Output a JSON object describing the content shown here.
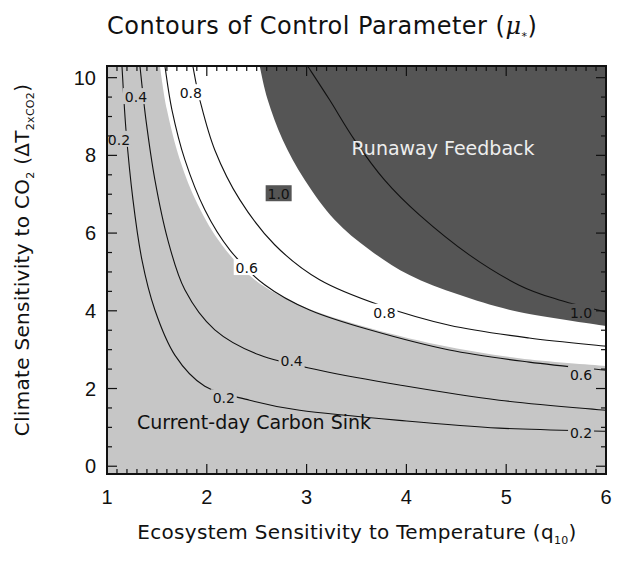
{
  "chart": {
    "title_main": "Contours of Control Parameter (",
    "title_symbol": "μ",
    "title_sub": "*",
    "title_end": ")",
    "xlabel_main": "Ecosystem Sensitivity to Temperature (q",
    "xlabel_sub": "10",
    "xlabel_end": ")",
    "ylabel_main": "Climate Sensitivity to CO",
    "ylabel_sub1": "2",
    "ylabel_mid": " (ΔT",
    "ylabel_sub2": "2xCO2",
    "ylabel_end": ")"
  },
  "chart_data": {
    "type": "contour",
    "title": "Contours of Control Parameter (μ*)",
    "xlabel": "Ecosystem Sensitivity to Temperature (q10)",
    "ylabel": "Climate Sensitivity to CO2 (ΔT2xCO2)",
    "xlim": [
      1,
      6
    ],
    "ylim": [
      -0.2,
      10.3
    ],
    "xticks": [
      1,
      2,
      3,
      4,
      5,
      6
    ],
    "yticks": [
      0,
      2,
      4,
      6,
      8,
      10
    ],
    "x_minor_step": 0.1,
    "y_minor_step": 0.5,
    "grid": false,
    "colors": {
      "current_sink_region": "#c6c6c6",
      "transition_band": "#ffffff",
      "runaway_region": "#555555",
      "contour_line": "#111111"
    },
    "regions": [
      {
        "name": "Current-day Carbon Sink",
        "fill": "#c6c6c6",
        "label_pos": [
          1.3,
          0.95
        ]
      },
      {
        "name": "Runaway Feedback",
        "fill": "#555555",
        "label_pos": [
          3.45,
          8.0
        ]
      }
    ],
    "band_boundaries": {
      "white_lower": [
        [
          1.53,
          10.3
        ],
        [
          1.6,
          9.18
        ],
        [
          1.73,
          7.89
        ],
        [
          1.91,
          6.73
        ],
        [
          2.15,
          5.7
        ],
        [
          2.48,
          4.8
        ],
        [
          2.93,
          4.15
        ],
        [
          3.53,
          3.63
        ],
        [
          4.33,
          3.12
        ],
        [
          5.13,
          2.78
        ],
        [
          6.0,
          2.58
        ]
      ],
      "dark_lower": [
        [
          2.53,
          10.3
        ],
        [
          2.61,
          9.43
        ],
        [
          2.76,
          8.4
        ],
        [
          2.98,
          7.37
        ],
        [
          3.28,
          6.34
        ],
        [
          3.63,
          5.57
        ],
        [
          4.03,
          4.92
        ],
        [
          4.53,
          4.41
        ],
        [
          5.13,
          3.97
        ],
        [
          6.0,
          3.61
        ]
      ]
    },
    "contours": [
      {
        "level": 0.2,
        "label": "0.2",
        "points": [
          [
            1.15,
            10.3
          ],
          [
            1.19,
            8.66
          ],
          [
            1.26,
            6.86
          ],
          [
            1.35,
            5.31
          ],
          [
            1.48,
            4.02
          ],
          [
            1.68,
            2.86
          ],
          [
            1.98,
            2.06
          ],
          [
            2.43,
            1.7
          ],
          [
            2.93,
            1.44
          ],
          [
            3.93,
            1.18
          ],
          [
            4.93,
            0.98
          ],
          [
            6.0,
            0.9
          ]
        ],
        "label_positions": [
          [
            1.12,
            8.4
          ],
          [
            2.17,
            1.75
          ],
          [
            5.75,
            0.85
          ]
        ]
      },
      {
        "level": 0.4,
        "label": "0.4",
        "points": [
          [
            1.33,
            10.3
          ],
          [
            1.39,
            8.92
          ],
          [
            1.48,
            7.37
          ],
          [
            1.61,
            5.82
          ],
          [
            1.78,
            4.54
          ],
          [
            2.08,
            3.51
          ],
          [
            2.53,
            2.86
          ],
          [
            3.13,
            2.47
          ],
          [
            3.93,
            2.09
          ],
          [
            4.93,
            1.7
          ],
          [
            6.0,
            1.44
          ]
        ],
        "label_positions": [
          [
            1.29,
            9.5
          ],
          [
            2.85,
            2.7
          ]
        ]
      },
      {
        "level": 0.6,
        "label": "0.6",
        "points": [
          [
            1.58,
            10.3
          ],
          [
            1.65,
            9.18
          ],
          [
            1.78,
            7.89
          ],
          [
            1.98,
            6.6
          ],
          [
            2.23,
            5.57
          ],
          [
            2.58,
            4.67
          ],
          [
            3.03,
            4.02
          ],
          [
            3.63,
            3.51
          ],
          [
            4.43,
            2.99
          ],
          [
            5.23,
            2.68
          ],
          [
            6.0,
            2.47
          ]
        ],
        "label_positions": [
          [
            2.4,
            5.1
          ],
          [
            5.75,
            2.35
          ]
        ]
      },
      {
        "level": 0.8,
        "label": "0.8",
        "points": [
          [
            1.86,
            10.3
          ],
          [
            1.93,
            9.43
          ],
          [
            2.08,
            8.14
          ],
          [
            2.33,
            6.86
          ],
          [
            2.68,
            5.7
          ],
          [
            3.13,
            4.8
          ],
          [
            3.73,
            4.15
          ],
          [
            4.43,
            3.63
          ],
          [
            5.23,
            3.3
          ],
          [
            6.0,
            3.09
          ]
        ],
        "label_positions": [
          [
            1.84,
            9.6
          ],
          [
            3.78,
            3.95
          ]
        ]
      },
      {
        "level": 1.0,
        "label": "1.0",
        "points": [
          [
            3.01,
            10.3
          ],
          [
            3.23,
            9.43
          ],
          [
            3.48,
            8.4
          ],
          [
            3.78,
            7.37
          ],
          [
            4.13,
            6.47
          ],
          [
            4.63,
            5.44
          ],
          [
            5.13,
            4.66
          ],
          [
            5.53,
            4.28
          ],
          [
            6.0,
            3.97
          ]
        ],
        "label_positions": [
          [
            2.72,
            7.0
          ],
          [
            5.75,
            3.95
          ]
        ]
      }
    ]
  }
}
